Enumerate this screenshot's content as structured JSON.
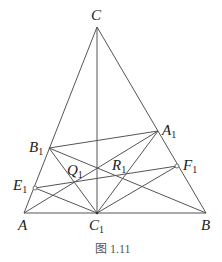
{
  "caption": "图 1.11",
  "points": {
    "C": {
      "label": "C",
      "sub": "",
      "x": 97,
      "y": 27
    },
    "A": {
      "label": "A",
      "sub": "",
      "x": 24,
      "y": 213
    },
    "B": {
      "label": "B",
      "sub": "",
      "x": 206,
      "y": 213
    },
    "C1": {
      "label": "C",
      "sub": "1",
      "x": 97,
      "y": 213
    },
    "A1": {
      "label": "A",
      "sub": "1",
      "x": 158,
      "y": 131
    },
    "B1": {
      "label": "B",
      "sub": "1",
      "x": 49,
      "y": 148
    },
    "E1": {
      "label": "E",
      "sub": "1",
      "x": 35,
      "y": 188
    },
    "F1": {
      "label": "F",
      "sub": "1",
      "x": 177,
      "y": 166
    },
    "Q1": {
      "label": "Q",
      "sub": "1"
    },
    "R1": {
      "label": "R",
      "sub": "1"
    }
  },
  "segments": [
    [
      "C",
      "A"
    ],
    [
      "C",
      "B"
    ],
    [
      "A",
      "B"
    ],
    [
      "C",
      "C1"
    ],
    [
      "B1",
      "A1"
    ],
    [
      "B1",
      "C1"
    ],
    [
      "A1",
      "C1"
    ],
    [
      "A",
      "A1"
    ],
    [
      "B",
      "B1"
    ],
    [
      "E1",
      "F1"
    ],
    [
      "E1",
      "C1"
    ],
    [
      "F1",
      "C1"
    ]
  ]
}
